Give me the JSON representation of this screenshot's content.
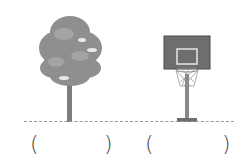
{
  "worksheet": {
    "items": [
      {
        "name": "tree",
        "answer_open": "(",
        "answer_close": ")"
      },
      {
        "name": "basketball-hoop",
        "answer_open": "(",
        "answer_close": ")"
      }
    ],
    "colors": {
      "foliage": "#8f8f8f",
      "foliage_dark": "#7a7a7a",
      "trunk": "#7d7d7d",
      "backboard": "#6e6e6e",
      "ground_line": "#9a9a9a"
    }
  }
}
